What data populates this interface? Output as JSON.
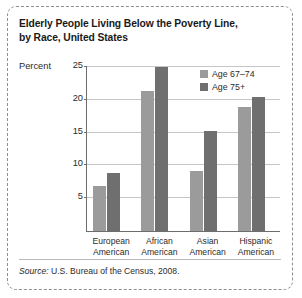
{
  "title": "Elderly People Living Below the Poverty Line, by Race, United States",
  "title_line1": "Elderly People Living Below the Poverty Line,",
  "title_line2": "by Race, United States",
  "axis": {
    "ylabel": "Percent"
  },
  "source": {
    "label": "Source:",
    "text": "U.S. Bureau of the Census, 2008."
  },
  "legend": [
    {
      "label": "Age 67–74",
      "color": "#9b9b9b"
    },
    {
      "label": "Age 75+",
      "color": "#6f6f6f"
    }
  ],
  "categories_wrapped": [
    {
      "line1": "European",
      "line2": "American"
    },
    {
      "line1": "African",
      "line2": "American"
    },
    {
      "line1": "Asian",
      "line2": "American"
    },
    {
      "line1": "Hispanic",
      "line2": "American"
    }
  ],
  "chart_data": {
    "type": "bar",
    "title": "Elderly People Living Below the Poverty Line, by Race, United States",
    "xlabel": "",
    "ylabel": "Percent",
    "ylim": [
      0,
      25
    ],
    "yticks": [
      5,
      10,
      15,
      20,
      25
    ],
    "grid": true,
    "legend_position": "top-right",
    "categories": [
      "European American",
      "African American",
      "Asian American",
      "Hispanic American"
    ],
    "series": [
      {
        "name": "Age 67–74",
        "color": "#9b9b9b",
        "values": [
          6.8,
          21.3,
          9.2,
          18.9
        ]
      },
      {
        "name": "Age 75+",
        "color": "#6f6f6f",
        "values": [
          8.8,
          25.0,
          15.2,
          20.4
        ]
      }
    ],
    "source": "Source: U.S. Bureau of the Census, 2008."
  }
}
